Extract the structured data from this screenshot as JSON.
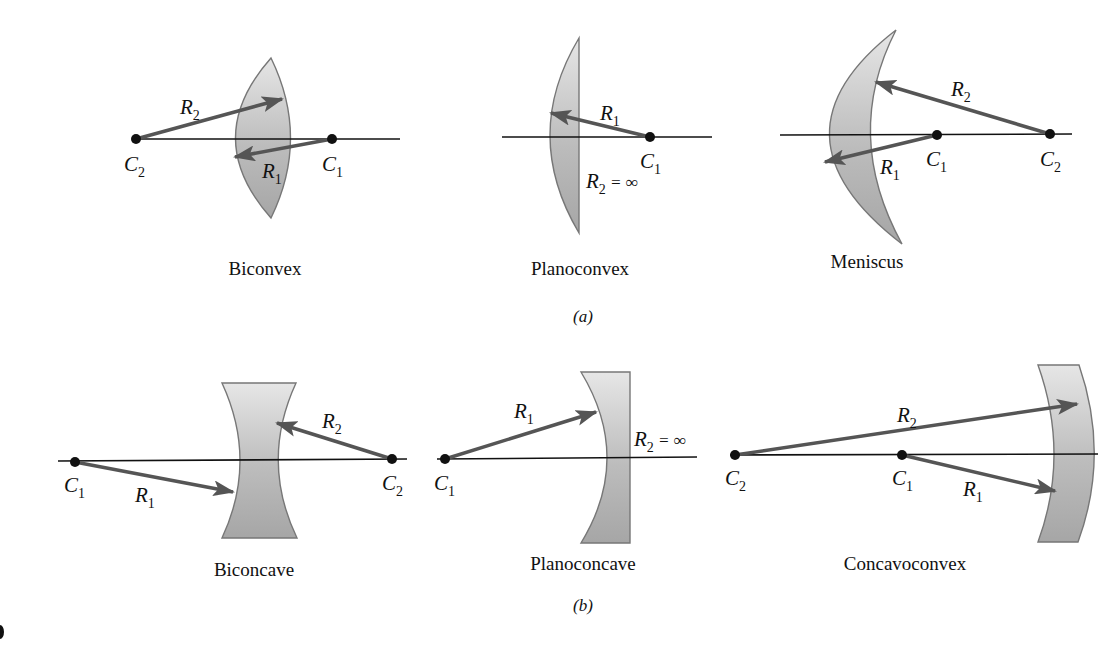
{
  "figure": {
    "part_a": {
      "label": "(a)",
      "lenses": [
        {
          "name": "Biconvex",
          "points": [
            "C2",
            "C1"
          ],
          "radii": [
            "R2",
            "R1"
          ]
        },
        {
          "name": "Planoconvex",
          "points": [
            "C1"
          ],
          "radii": [
            "R1"
          ],
          "note": "R2 = ∞"
        },
        {
          "name": "Meniscus",
          "points": [
            "C1",
            "C2"
          ],
          "radii": [
            "R2",
            "R1"
          ]
        }
      ]
    },
    "part_b": {
      "label": "(b)",
      "lenses": [
        {
          "name": "Biconcave",
          "points": [
            "C1",
            "C2"
          ],
          "radii": [
            "R2",
            "R1"
          ]
        },
        {
          "name": "Planoconcave",
          "points": [
            "C1"
          ],
          "radii": [
            "R1"
          ],
          "note": "R2 = ∞"
        },
        {
          "name": "Concavoconvex",
          "points": [
            "C2",
            "C1"
          ],
          "radii": [
            "R2",
            "R1"
          ]
        }
      ]
    },
    "symbols": {
      "C": "C",
      "R": "R",
      "sub1": "1",
      "sub2": "2",
      "infinity_eq": " = ∞"
    },
    "colors": {
      "lens_fill_light": "#e4e4e4",
      "lens_fill_dark": "#a8a8a8",
      "ray": "#555555",
      "axis": "#111111"
    }
  }
}
